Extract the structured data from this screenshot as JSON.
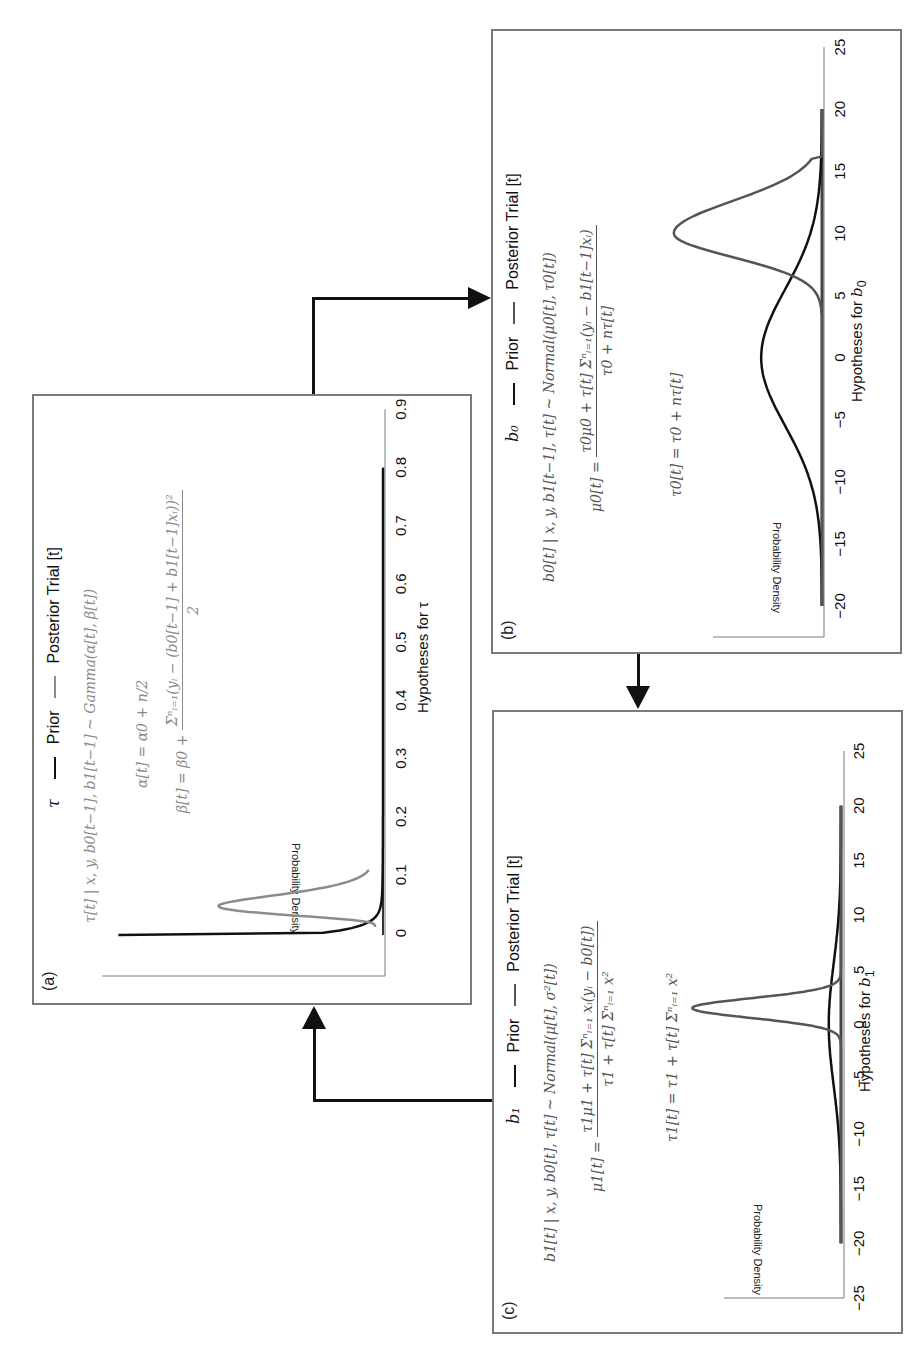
{
  "panels": {
    "a": {
      "label": "(a)",
      "legend": {
        "symbol": "τ",
        "prior": "Prior",
        "posterior": "Posterior Trial [t]"
      },
      "equations": {
        "dist": "τ[t] | x, y, b0[t−1], b1[t−1] ~ Gamma(α[t], β[t])",
        "alpha": "α[t] = α0 + n/2",
        "beta_lhs": "β[t] = β0 +",
        "beta_num": "Σⁿᵢ₌₁(yᵢ − (b0[t−1] + b1[t−1]xᵢ))²",
        "beta_den": "2"
      },
      "ylabel": "Probability Density",
      "xlabel": "Hypotheses for τ",
      "ticks": [
        "0",
        "0.1",
        "0.2",
        "0.3",
        "0.4",
        "0.5",
        "0.6",
        "0.7",
        "0.8",
        "0.9"
      ]
    },
    "b": {
      "label": "(b)",
      "legend": {
        "symbol": "b₀",
        "prior": "Prior",
        "posterior": "Posterior Trial [t]"
      },
      "equations": {
        "dist": "b0[t] | x, y, b1[t−1], τ[t] ~ Normal(μ0[t], τ0[t])",
        "mu_lhs": "μ0[t] =",
        "mu_num": "τ0μ0 + τ[t] Σⁿᵢ₌₁(yᵢ − b1[t−1]xᵢ)",
        "mu_den": "τ0 + nτ[t]",
        "tau": "τ0[t] = τ0 + nτ[t]"
      },
      "ylabel": "Probability Density",
      "xlabel_prefix": "Hypotheses for ",
      "xlabel_var": "b",
      "xlabel_sub": "0",
      "ticks": [
        "−20",
        "−15",
        "−10",
        "−5",
        "0",
        "5",
        "10",
        "15",
        "20",
        "25"
      ]
    },
    "c": {
      "label": "(c)",
      "legend": {
        "symbol": "b₁",
        "prior": "Prior",
        "posterior": "Posterior Trial [t]"
      },
      "equations": {
        "dist": "b1[t] | x, y, b0[t], τ[t] ~ Normal(μ[t], σ²[t])",
        "mu_lhs": "μ1[t] =",
        "mu_num": "τ1μ1 + τ[t] Σⁿᵢ₌₁ xᵢ(yᵢ − b0[t])",
        "mu_den": "τ1 + τ[t] Σⁿᵢ₌₁ x²",
        "tau": "τ1[t] = τ1 + τ[t] Σⁿᵢ₌₁ x²"
      },
      "ylabel": "Probability Density",
      "xlabel_prefix": "Hypotheses for ",
      "xlabel_var": "b",
      "xlabel_sub": "1",
      "ticks": [
        "−25",
        "−20",
        "−15",
        "−10",
        "−5",
        "0",
        "5",
        "10",
        "15",
        "20",
        "25"
      ]
    }
  },
  "colors": {
    "prior": "#111111",
    "posterior_a": "#8c8c8c",
    "posterior_bc": "#555555",
    "frame": "#7a7a7a"
  },
  "chart_data": [
    {
      "type": "line",
      "title": "(a) τ — Prior — Posterior Trial [t]",
      "xlabel": "Hypotheses for τ",
      "ylabel": "Probability Density",
      "xlim": [
        0,
        0.9
      ],
      "x_ticks": [
        0,
        0.1,
        0.2,
        0.3,
        0.4,
        0.5,
        0.6,
        0.7,
        0.8,
        0.9
      ],
      "grid": false,
      "series": [
        {
          "name": "Prior",
          "color": "#111111",
          "distribution": "Gamma",
          "x": [
            0,
            0.005,
            0.01,
            0.02,
            0.03,
            0.05,
            0.08,
            0.1,
            0.2,
            0.4,
            0.8
          ],
          "y": [
            1.0,
            0.6,
            0.35,
            0.15,
            0.08,
            0.035,
            0.015,
            0.008,
            0.002,
            0.0,
            0.0
          ]
        },
        {
          "name": "Posterior Trial [t]",
          "color": "#8c8c8c",
          "distribution": "Gamma",
          "x": [
            0,
            0.01,
            0.02,
            0.03,
            0.04,
            0.05,
            0.06,
            0.07,
            0.08,
            0.09
          ],
          "y": [
            0.0,
            0.05,
            0.35,
            0.72,
            0.55,
            0.3,
            0.14,
            0.06,
            0.02,
            0.0
          ]
        }
      ]
    },
    {
      "type": "line",
      "title": "(b) b0 — Prior — Posterior Trial [t]",
      "xlabel": "Hypotheses for b0",
      "ylabel": "Probability Density",
      "xlim": [
        -20,
        25
      ],
      "x_ticks": [
        -20,
        -15,
        -10,
        -5,
        0,
        5,
        10,
        15,
        20,
        25
      ],
      "grid": false,
      "series": [
        {
          "name": "Prior",
          "color": "#111111",
          "distribution": "Normal",
          "mean": 0,
          "sd": 5.5,
          "peak": 0.32,
          "x_range": [
            -20,
            20
          ]
        },
        {
          "name": "Posterior Trial [t]",
          "color": "#555555",
          "distribution": "Normal",
          "mean": 10,
          "sd": 2.4,
          "peak": 0.78,
          "x_range": [
            -20,
            20
          ]
        }
      ]
    },
    {
      "type": "line",
      "title": "(c) b1 — Prior — Posterior Trial [t]",
      "xlabel": "Hypotheses for b1",
      "ylabel": "Probability Density",
      "xlim": [
        -25,
        25
      ],
      "x_ticks": [
        -25,
        -20,
        -15,
        -10,
        -5,
        0,
        5,
        10,
        15,
        20,
        25
      ],
      "grid": false,
      "series": [
        {
          "name": "Prior",
          "color": "#111111",
          "distribution": "Normal",
          "mean": 0,
          "sd": 5.5,
          "peak": 0.07,
          "x_range": [
            -20,
            20
          ]
        },
        {
          "name": "Posterior Trial [t]",
          "color": "#555555",
          "distribution": "Normal",
          "mean": 1.5,
          "sd": 0.9,
          "peak": 0.85,
          "x_range": [
            -20,
            20
          ]
        }
      ]
    }
  ]
}
